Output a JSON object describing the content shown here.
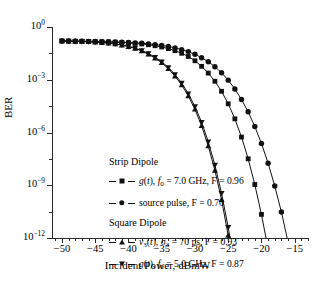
{
  "figure": {
    "background": "#ffffff",
    "ink": "#111111"
  },
  "chart_data": {
    "type": "line",
    "title": "",
    "xlabel": "Incident Power, dBmW",
    "ylabel": "BER",
    "xlim": [
      -51.5,
      -13.0
    ],
    "ylim": [
      1e-12,
      1.0
    ],
    "yscale": "log",
    "xscale": "linear",
    "grid": false,
    "legend_position": "center-left inside axes",
    "xticks": [
      -50,
      -45,
      -40,
      -35,
      -30,
      -25,
      -20,
      -15
    ],
    "xticklabels": [
      "−50",
      "−45",
      "−40",
      "−35",
      "−30",
      "−25",
      "−20",
      "−15"
    ],
    "x_minor_ticks_per_interval": 5,
    "yticks": [
      1,
      0.001,
      1e-06,
      1e-09,
      1e-12
    ],
    "yticklabels": [
      "10",
      "10",
      "10",
      "10",
      "10"
    ],
    "ytick_exponents": [
      "0",
      "−3",
      "−6",
      "−9",
      "−12"
    ],
    "legend_groups": [
      {
        "heading": "Strip Dipole",
        "entries": [
          {
            "marker": "square",
            "label_html": "<i>g</i>(<i>t</i>), <i>f</i><sub>0</sub> = 7.0 GHz, F = 0.96",
            "label_text": "g(t), f0 = 7.0 GHz, F = 0.96",
            "series": "strip_gt_7ghz"
          },
          {
            "marker": "circle",
            "label_html": "source pulse, F = 0.70",
            "label_text": "source pulse, F = 0.70",
            "series": "strip_source_pulse"
          }
        ]
      },
      {
        "heading": "Square Dipole",
        "entries": [
          {
            "marker": "triangle-up",
            "label_html": "<i>v</i><sub>3</sub>(<i>t</i>), σ<sub>3</sub> = 70 ps, F = 0.93",
            "label_text": "v3(t), sigma3 = 70 ps, F = 0.93",
            "series": "square_v3_70ps"
          },
          {
            "marker": "triangle-down",
            "label_html": "<i>g</i>(<i>t</i>), <i>f</i><sub>0</sub> = 5.0 GHz, F = 0.87",
            "label_text": "g(t), f0 = 5.0 GHz, F = 0.87",
            "series": "square_gt_5ghz"
          }
        ]
      }
    ],
    "series": [
      {
        "name": "source pulse, F = 0.70",
        "key": "strip_source_pulse",
        "marker": "circle",
        "x": [
          -50,
          -49,
          -48,
          -47,
          -46,
          -45,
          -44,
          -43,
          -42,
          -41,
          -40,
          -39,
          -38,
          -37,
          -36,
          -35,
          -34,
          -33,
          -32,
          -31,
          -30,
          -29,
          -28,
          -27,
          -26,
          -25,
          -24,
          -23,
          -22,
          -21,
          -20,
          -19,
          -18,
          -17,
          -16,
          -15,
          -14
        ],
        "y": [
          0.16,
          0.158,
          0.156,
          0.154,
          0.152,
          0.15,
          0.147,
          0.144,
          0.14,
          0.136,
          0.131,
          0.125,
          0.118,
          0.11,
          0.1,
          0.09,
          0.078,
          0.065,
          0.052,
          0.04,
          0.028,
          0.018,
          0.0105,
          0.0055,
          0.0025,
          0.00095,
          0.0003,
          7.5e-05,
          1.5e-05,
          2.2e-06,
          2.4e-07,
          1.8e-08,
          9e-10,
          3e-11,
          6e-13,
          1e-14,
          1e-16
        ]
      },
      {
        "name": "g(t), f0 = 7.0 GHz, F = 0.96",
        "key": "strip_gt_7ghz",
        "marker": "square",
        "x": [
          -50,
          -49,
          -48,
          -47,
          -46,
          -45,
          -44,
          -43,
          -42,
          -41,
          -40,
          -39,
          -38,
          -37,
          -36,
          -35,
          -34,
          -33,
          -32,
          -31,
          -30,
          -29,
          -28,
          -27,
          -26,
          -25,
          -24,
          -23,
          -22,
          -21,
          -20,
          -19,
          -18,
          -17,
          -16
        ],
        "y": [
          0.16,
          0.158,
          0.156,
          0.154,
          0.151,
          0.148,
          0.145,
          0.141,
          0.136,
          0.131,
          0.125,
          0.117,
          0.108,
          0.098,
          0.086,
          0.073,
          0.059,
          0.045,
          0.032,
          0.021,
          0.012,
          0.0058,
          0.0024,
          0.00082,
          0.00022,
          4.3e-05,
          6e-06,
          5.5e-07,
          3.2e-08,
          1.1e-09,
          2.2e-11,
          2.4e-13,
          1e-15,
          1e-17,
          1e-19
        ]
      },
      {
        "name": "g(t), f0 = 5.0 GHz, F = 0.87",
        "key": "square_gt_5ghz",
        "marker": "triangle-down",
        "x": [
          -50,
          -49,
          -48,
          -47,
          -46,
          -45,
          -44,
          -43,
          -42,
          -41,
          -40,
          -39,
          -38,
          -37,
          -36,
          -35,
          -34,
          -33,
          -32,
          -31,
          -30,
          -29,
          -28,
          -27,
          -26,
          -25,
          -24
        ],
        "y": [
          0.16,
          0.157,
          0.154,
          0.15,
          0.145,
          0.139,
          0.131,
          0.122,
          0.11,
          0.096,
          0.08,
          0.063,
          0.046,
          0.031,
          0.019,
          0.0105,
          0.005,
          0.002,
          0.00065,
          0.00016,
          3e-05,
          3.8e-06,
          3e-07,
          1.4e-08,
          3.5e-10,
          4e-12,
          2e-14
        ]
      },
      {
        "name": "v3(t), sigma3 = 70 ps, F = 0.93",
        "key": "square_v3_70ps",
        "marker": "triangle-up",
        "x": [
          -50,
          -49,
          -48,
          -47,
          -46,
          -45,
          -44,
          -43,
          -42,
          -41,
          -40,
          -39,
          -38,
          -37,
          -36,
          -35,
          -34,
          -33,
          -32,
          -31,
          -30,
          -29,
          -28,
          -27,
          -26,
          -25,
          -24
        ],
        "y": [
          0.16,
          0.157,
          0.153,
          0.149,
          0.144,
          0.137,
          0.129,
          0.119,
          0.107,
          0.093,
          0.077,
          0.06,
          0.043,
          0.028,
          0.017,
          0.0092,
          0.0042,
          0.0016,
          0.0005,
          0.00012,
          2.1e-05,
          2.4e-06,
          1.7e-07,
          7e-09,
          1.5e-10,
          1.4e-12,
          5e-15
        ]
      }
    ]
  }
}
